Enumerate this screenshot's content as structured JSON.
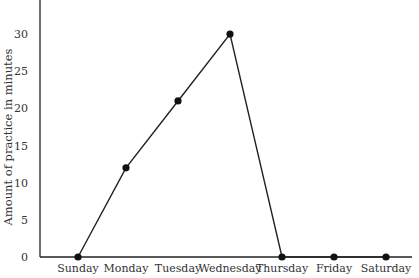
{
  "chart_data": {
    "type": "line",
    "title": "",
    "xlabel": "",
    "ylabel": "Amount of practice in minutes",
    "categories": [
      "Sunday",
      "Monday",
      "Tuesday",
      "Wednesday",
      "Thursday",
      "Friday",
      "Saturday"
    ],
    "values": [
      0,
      12,
      21,
      30,
      0,
      0,
      0
    ],
    "yticks": [
      0,
      5,
      10,
      15,
      20,
      25,
      30
    ],
    "ylim": [
      0,
      34
    ],
    "grid": false,
    "legend": null,
    "line_color": "#222222",
    "marker": "filled-circle"
  }
}
